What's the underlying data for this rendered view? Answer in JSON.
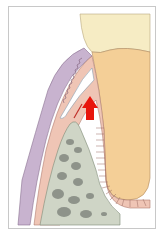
{
  "figure": {
    "type": "dental periodontal cross-section illustration",
    "caption": "",
    "arrow_direction": "up",
    "colors": {
      "crown": "#f6ecc4",
      "root_dentin": "#f4cf97",
      "gingiva": "#efc5b5",
      "epithelium": "#c8b3cf",
      "bone": "#cfd5c6",
      "bone_marrow": "#8e938a",
      "pocket": "#ffffff",
      "arrow": "#e8160d",
      "outline": "#7a5a55"
    }
  }
}
